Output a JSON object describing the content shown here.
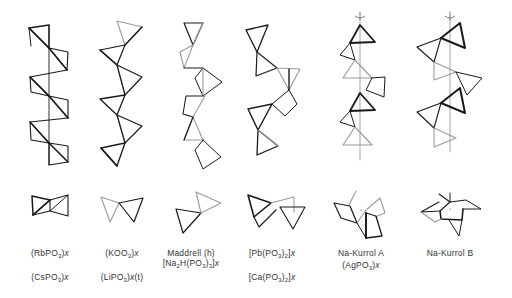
{
  "figure": {
    "type": "polyphosphate-chain-structures",
    "view_rows": [
      "side-view chain",
      "projection along chain axis"
    ],
    "columns": [
      {
        "id": "rbpo3",
        "labels": [
          {
            "text": "(RbPO3)x",
            "html": "(RbPO<sub>3</sub>)<i>x</i>"
          },
          {
            "text": "(CsPO3)x",
            "html": "(CsPO<sub>3</sub>)<i>x</i>"
          }
        ],
        "axis_shown": false
      },
      {
        "id": "koo3",
        "labels": [
          {
            "text": "(KOO3)x",
            "html": "(KOO<sub>3</sub>)<i>x</i>"
          },
          {
            "text": "(LiPO3)x(t)",
            "html": "(LiPO<sub>3</sub>)<i>x</i>(t)"
          }
        ],
        "axis_shown": false
      },
      {
        "id": "maddrell",
        "labels": [
          {
            "text": "Maddrell (h)",
            "html": "Maddrell (h)"
          },
          {
            "text": "[Na2H(PO3)3]x",
            "html": "[Na<sub>2</sub>H(PO<sub>3</sub>)<sub>3</sub>]<i>x</i>"
          }
        ],
        "axis_shown": false
      },
      {
        "id": "pbpo3",
        "labels": [
          {
            "text": "[Pb(PO3)2]x",
            "html": "[Pb(PO<sub>3</sub>)<sub>2</sub>]<i>x</i>"
          },
          {
            "text": "[Ca(PO3)2]x",
            "html": "[Ca(PO<sub>3</sub>)<sub>2</sub>]<i>x</i>"
          }
        ],
        "axis_shown": false
      },
      {
        "id": "na-kurrol-a",
        "labels": [
          {
            "text": "Na-Kurrol A",
            "html": "Na-Kurrol A"
          },
          {
            "text": "(AgPO3)x",
            "html": "(AgPO<sub>3</sub>)<i>x</i>"
          }
        ],
        "axis_shown": true,
        "screw_axis_symbol": "rotation-arrow"
      },
      {
        "id": "na-kurrol-b",
        "labels": [
          {
            "text": "Na-Kurrol B",
            "html": "Na-Kurrol B"
          }
        ],
        "axis_shown": true,
        "screw_axis_symbol": "rotation-arrow"
      }
    ]
  },
  "colors": {
    "background": "#ffffff",
    "heavy_stroke": "#1a1a1a",
    "light_stroke": "#9a9a9a",
    "axis": "#b5b5b5",
    "text": "#333333"
  }
}
